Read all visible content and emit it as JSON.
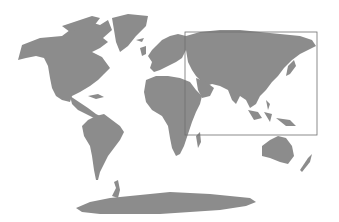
{
  "map": {
    "projection": "world",
    "land_color": "#8c8c8c",
    "background_color": "#ffffff",
    "highlight": {
      "region": "Asia",
      "stroke_color": "#6f6f6f",
      "x": 185,
      "y": 32,
      "width": 132,
      "height": 103
    },
    "labels": []
  }
}
